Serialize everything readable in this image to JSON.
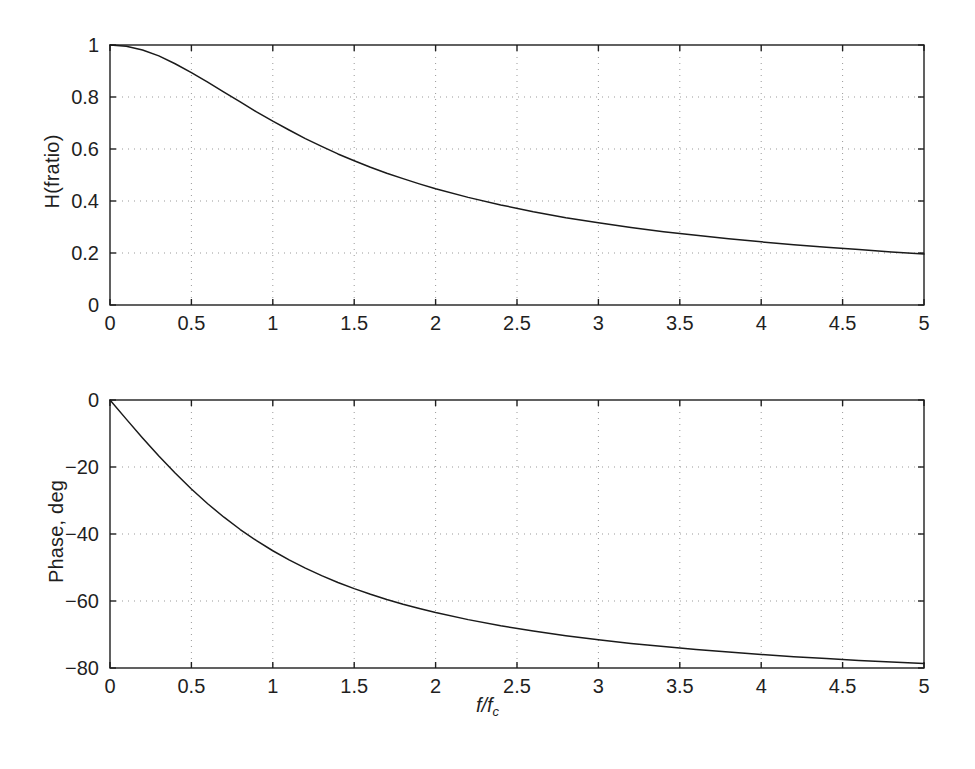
{
  "figure": {
    "background": "#ffffff",
    "axis_color": "#1f1f1f",
    "curve_color": "#1a1a1a",
    "grid_color": "#999999",
    "xlabel_main": "f/f",
    "xlabel_sub": "c"
  },
  "chart_data": [
    {
      "type": "line",
      "title": "",
      "xlabel": "f/f_c",
      "ylabel": "H(fratio)",
      "xlim": [
        0,
        5
      ],
      "ylim": [
        0,
        1
      ],
      "grid": true,
      "legend": "none",
      "xticks": [
        "0",
        "0.5",
        "1",
        "1.5",
        "2",
        "2.5",
        "3",
        "3.5",
        "4",
        "4.5",
        "5"
      ],
      "xtick_values": [
        0,
        0.5,
        1,
        1.5,
        2,
        2.5,
        3,
        3.5,
        4,
        4.5,
        5
      ],
      "yticks": [
        "0",
        "0.2",
        "0.4",
        "0.6",
        "0.8",
        "1"
      ],
      "ytick_values": [
        0,
        0.2,
        0.4,
        0.6,
        0.8,
        1
      ],
      "series": [
        {
          "name": "magnitude",
          "x": [
            0,
            0.1,
            0.2,
            0.3,
            0.4,
            0.5,
            0.6,
            0.7,
            0.8,
            0.9,
            1,
            1.1,
            1.2,
            1.3,
            1.4,
            1.5,
            1.6,
            1.7,
            1.8,
            1.9,
            2,
            2.2,
            2.4,
            2.6,
            2.8,
            3,
            3.2,
            3.4,
            3.6,
            3.8,
            4,
            4.2,
            4.4,
            4.6,
            4.8,
            5
          ],
          "values": [
            1.0,
            0.995,
            0.981,
            0.958,
            0.928,
            0.894,
            0.857,
            0.819,
            0.781,
            0.743,
            0.707,
            0.673,
            0.64,
            0.61,
            0.581,
            0.555,
            0.53,
            0.507,
            0.486,
            0.466,
            0.447,
            0.414,
            0.385,
            0.359,
            0.336,
            0.316,
            0.298,
            0.282,
            0.268,
            0.255,
            0.243,
            0.232,
            0.222,
            0.213,
            0.204,
            0.196
          ]
        }
      ]
    },
    {
      "type": "line",
      "title": "",
      "xlabel": "f/f_c",
      "ylabel": "Phase, deg",
      "xlim": [
        0,
        5
      ],
      "ylim": [
        -80,
        0
      ],
      "grid": true,
      "legend": "none",
      "xticks": [
        "0",
        "0.5",
        "1",
        "1.5",
        "2",
        "2.5",
        "3",
        "3.5",
        "4",
        "4.5",
        "5"
      ],
      "xtick_values": [
        0,
        0.5,
        1,
        1.5,
        2,
        2.5,
        3,
        3.5,
        4,
        4.5,
        5
      ],
      "yticks": [
        "0",
        "−20",
        "−40",
        "−60",
        "−80"
      ],
      "ytick_values": [
        0,
        -20,
        -40,
        -60,
        -80
      ],
      "series": [
        {
          "name": "phase",
          "x": [
            0,
            0.1,
            0.2,
            0.3,
            0.4,
            0.5,
            0.6,
            0.7,
            0.8,
            0.9,
            1,
            1.1,
            1.2,
            1.3,
            1.4,
            1.5,
            1.6,
            1.7,
            1.8,
            1.9,
            2,
            2.2,
            2.4,
            2.6,
            2.8,
            3,
            3.2,
            3.4,
            3.6,
            3.8,
            4,
            4.2,
            4.4,
            4.6,
            4.8,
            5
          ],
          "values": [
            0,
            -5.71,
            -11.31,
            -16.7,
            -21.8,
            -26.57,
            -30.96,
            -34.99,
            -38.66,
            -41.99,
            -45.0,
            -47.73,
            -50.19,
            -52.43,
            -54.46,
            -56.31,
            -57.99,
            -59.53,
            -60.95,
            -62.24,
            -63.43,
            -65.56,
            -67.38,
            -68.96,
            -70.35,
            -71.57,
            -72.65,
            -73.61,
            -74.48,
            -75.26,
            -75.96,
            -76.61,
            -77.2,
            -77.74,
            -78.23,
            -78.69
          ]
        }
      ]
    }
  ]
}
